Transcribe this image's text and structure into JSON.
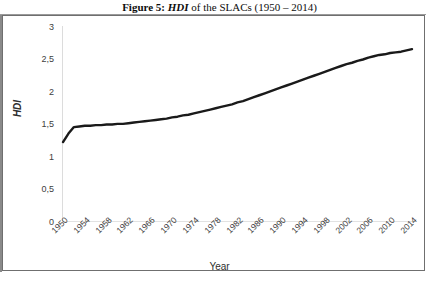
{
  "caption": {
    "figure_label": "Figure 5:",
    "italic_term": "HDI",
    "rest": " of the SLACs (1950 – 2014)"
  },
  "axes": {
    "y_title": "HDI",
    "x_title": "Year",
    "y_ticks": [
      "0",
      "0,5",
      "1",
      "1,5",
      "2",
      "2,5",
      "3"
    ],
    "x_ticks": [
      "1950",
      "1954",
      "1958",
      "1962",
      "1966",
      "1970",
      "1974",
      "1978",
      "1982",
      "1986",
      "1990",
      "1994",
      "1998",
      "2002",
      "2006",
      "2010",
      "2014"
    ]
  },
  "colors": {
    "line": "#1a1a1a",
    "axis": "#d9d9d9",
    "frame": "#6f6f6f",
    "tick_text": "#404040"
  },
  "chart_data": {
    "type": "line",
    "title": "Figure 5: HDI of the SLACs (1950 – 2014)",
    "xlabel": "Year",
    "ylabel": "HDI",
    "xlim": [
      1950,
      2014
    ],
    "ylim": [
      0,
      3
    ],
    "y_tick_values": [
      0,
      0.5,
      1,
      1.5,
      2,
      2.5,
      3
    ],
    "x_tick_values": [
      1950,
      1954,
      1958,
      1962,
      1966,
      1970,
      1974,
      1978,
      1982,
      1986,
      1990,
      1994,
      1998,
      2002,
      2006,
      2010,
      2014
    ],
    "grid": false,
    "legend": null,
    "decimal_separator": ",",
    "series": [
      {
        "name": "HDI",
        "color": "#1a1a1a",
        "x": [
          1950,
          1951,
          1952,
          1953,
          1954,
          1955,
          1956,
          1957,
          1958,
          1959,
          1960,
          1961,
          1962,
          1963,
          1964,
          1965,
          1966,
          1967,
          1968,
          1969,
          1970,
          1971,
          1972,
          1973,
          1974,
          1975,
          1976,
          1977,
          1978,
          1979,
          1980,
          1981,
          1982,
          1983,
          1984,
          1985,
          1986,
          1987,
          1988,
          1989,
          1990,
          1991,
          1992,
          1993,
          1994,
          1995,
          1996,
          1997,
          1998,
          1999,
          2000,
          2001,
          2002,
          2003,
          2004,
          2005,
          2006,
          2007,
          2008,
          2009,
          2010,
          2011,
          2012,
          2013,
          2014
        ],
        "y": [
          1.23,
          1.36,
          1.46,
          1.47,
          1.48,
          1.48,
          1.49,
          1.49,
          1.5,
          1.5,
          1.51,
          1.51,
          1.52,
          1.53,
          1.54,
          1.55,
          1.56,
          1.57,
          1.58,
          1.59,
          1.61,
          1.62,
          1.64,
          1.65,
          1.67,
          1.69,
          1.71,
          1.73,
          1.75,
          1.77,
          1.79,
          1.81,
          1.84,
          1.86,
          1.89,
          1.92,
          1.95,
          1.98,
          2.01,
          2.04,
          2.07,
          2.1,
          2.13,
          2.16,
          2.19,
          2.22,
          2.25,
          2.28,
          2.31,
          2.34,
          2.37,
          2.4,
          2.43,
          2.45,
          2.48,
          2.5,
          2.53,
          2.55,
          2.57,
          2.58,
          2.6,
          2.61,
          2.62,
          2.64,
          2.66
        ]
      }
    ]
  }
}
